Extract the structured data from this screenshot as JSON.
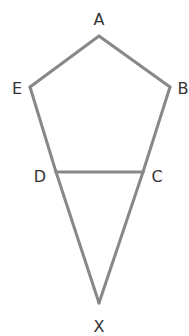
{
  "diagram": {
    "stroke_color": "#888888",
    "label_color": "#333333",
    "stroke_width": 3,
    "vertices": {
      "A": {
        "x": 99,
        "y": 36
      },
      "B": {
        "x": 170,
        "y": 87
      },
      "C": {
        "x": 143,
        "y": 172
      },
      "D": {
        "x": 56,
        "y": 172
      },
      "E": {
        "x": 30,
        "y": 87
      },
      "X": {
        "x": 99,
        "y": 303
      }
    },
    "labels": {
      "A": "A",
      "B": "B",
      "C": "C",
      "D": "D",
      "E": "E",
      "X": "X"
    },
    "segments": [
      [
        "A",
        "B"
      ],
      [
        "A",
        "E"
      ],
      [
        "B",
        "C"
      ],
      [
        "C",
        "X"
      ],
      [
        "E",
        "D"
      ],
      [
        "D",
        "X"
      ],
      [
        "D",
        "C"
      ]
    ]
  }
}
